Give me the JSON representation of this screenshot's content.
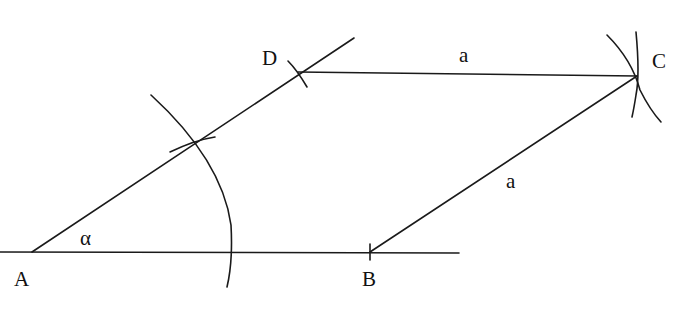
{
  "diagram": {
    "points": {
      "A": "A",
      "B": "B",
      "C": "C",
      "D": "D"
    },
    "angle_label": "α",
    "side_labels": {
      "DC": "a",
      "BC": "a"
    },
    "colors": {
      "stroke": "#1a1a1a",
      "background": "#ffffff"
    }
  }
}
